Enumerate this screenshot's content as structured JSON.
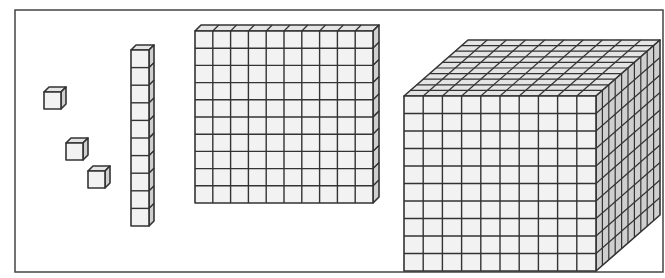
{
  "diagram": {
    "type": "base-ten-blocks",
    "frame": {
      "x": 15,
      "y": 10,
      "width": 648,
      "height": 262
    },
    "colors": {
      "stroke": "#333333",
      "front_fill": "#f2f2f2",
      "top_fill": "#e4e4e4",
      "side_fill": "#cfcfcf",
      "frame_stroke": "#444444",
      "background": "#ffffff"
    },
    "blocks": [
      {
        "kind": "unit",
        "name": "unit-cube-1",
        "value": 1,
        "x": 44,
        "y": 92,
        "w": 17,
        "h": 17,
        "dx": 5,
        "dy": 5,
        "cols": 1,
        "rows": 1
      },
      {
        "kind": "unit",
        "name": "unit-cube-2",
        "value": 1,
        "x": 66,
        "y": 143,
        "w": 17,
        "h": 17,
        "dx": 5,
        "dy": 5,
        "cols": 1,
        "rows": 1
      },
      {
        "kind": "unit",
        "name": "unit-cube-3",
        "value": 1,
        "x": 88,
        "y": 171,
        "w": 17,
        "h": 17,
        "dx": 5,
        "dy": 5,
        "cols": 1,
        "rows": 1
      },
      {
        "kind": "rod",
        "name": "ten-rod",
        "value": 10,
        "x": 131,
        "y": 50,
        "w": 18,
        "h": 176,
        "dx": 5,
        "dy": 5,
        "cols": 1,
        "rows": 10
      },
      {
        "kind": "flat",
        "name": "hundred-flat",
        "value": 100,
        "x": 195,
        "y": 31,
        "w": 178,
        "h": 172,
        "dx": 6,
        "dy": 6,
        "cols": 10,
        "rows": 10
      },
      {
        "kind": "cube",
        "name": "thousand-cube",
        "value": 1000,
        "x": 404,
        "y": 96,
        "w": 192,
        "h": 175,
        "dx": 64,
        "dy": 56,
        "cols": 10,
        "rows": 10,
        "depth": 10
      }
    ]
  }
}
